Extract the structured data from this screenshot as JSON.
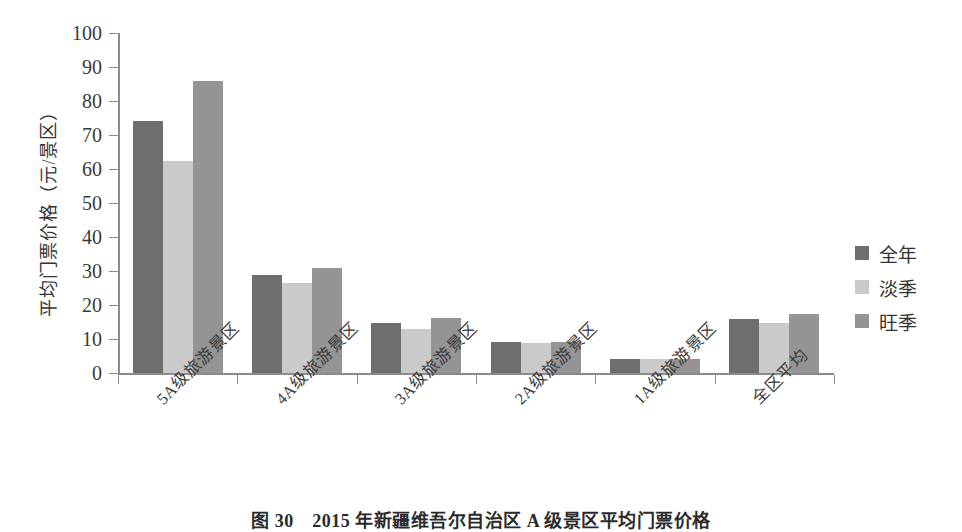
{
  "chart_data": {
    "type": "bar",
    "title": "",
    "xlabel": "",
    "ylabel": "平均门票价格（元/景区）",
    "ylim": [
      0,
      100
    ],
    "yticks": [
      0,
      10,
      20,
      30,
      40,
      50,
      60,
      70,
      80,
      90,
      100
    ],
    "grid": false,
    "legend_position": "right",
    "categories": [
      "5A级旅游景区",
      "4A级旅游景区",
      "3A级旅游景区",
      "2A级旅游景区",
      "1A级旅游景区",
      "全区平均"
    ],
    "series": [
      {
        "name": "全年",
        "color": "#6e6e6e",
        "values": [
          74,
          28.8,
          14.7,
          9.2,
          4.1,
          16.0
        ]
      },
      {
        "name": "淡季",
        "color": "#cacaca",
        "values": [
          62.5,
          26.5,
          13.0,
          8.8,
          4.0,
          14.8
        ]
      },
      {
        "name": "旺季",
        "color": "#949494",
        "values": [
          86,
          31.0,
          16.2,
          9.1,
          4.0,
          17.3
        ]
      }
    ]
  },
  "legend": {
    "items": [
      {
        "label": "全年",
        "swatch": "#6e6e6e"
      },
      {
        "label": "淡季",
        "swatch": "#cacaca"
      },
      {
        "label": "旺季",
        "swatch": "#949494"
      }
    ]
  },
  "caption": {
    "text": "图 30　2015 年新疆维吾尔自治区 A 级景区平均门票价格"
  },
  "colors": {
    "axis": "#8b8b8b",
    "text": "#3a3a3a",
    "series_year": "#6e6e6e",
    "series_low": "#cacaca",
    "series_high": "#949494"
  }
}
